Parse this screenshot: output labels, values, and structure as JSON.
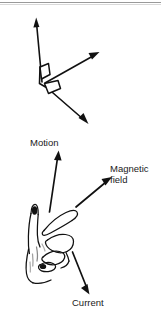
{
  "figure": {
    "title_text": "",
    "stroke_color": "#111111",
    "background_color": "#ffffff",
    "rule_color": "#9a9a9a",
    "axes_diagram": {
      "name": "three-perpendicular-axes",
      "vertex": [
        42,
        80
      ],
      "arrows": [
        {
          "name": "vertical-axis-arrow",
          "from": [
            42,
            80
          ],
          "to": [
            36,
            19
          ],
          "direction": "up"
        },
        {
          "name": "upper-right-axis-arrow",
          "from": [
            44,
            82
          ],
          "to": [
            98,
            52
          ],
          "direction": "up-right"
        },
        {
          "name": "lower-right-axis-arrow",
          "from": [
            44,
            84
          ],
          "to": [
            88,
            124
          ],
          "direction": "down-right"
        }
      ],
      "right_angle_markers": 2
    },
    "hand_diagram": {
      "name": "right-hand-fleming-rule",
      "description": "open right hand with thumb, index finger and middle finger mutually perpendicular"
    },
    "labels": [
      {
        "id": "motion",
        "text": "Motion",
        "x": 30,
        "y": 137
      },
      {
        "id": "magnetic_field",
        "text": "Magnetic\nfield",
        "line1": "Magnetic",
        "line2": "field",
        "x": 110,
        "y": 163
      },
      {
        "id": "current",
        "text": "Current",
        "x": 72,
        "y": 297
      }
    ],
    "annotation_arrows": [
      {
        "name": "motion-arrow",
        "label": "Motion",
        "from": [
          49,
          210
        ],
        "to": [
          58,
          152
        ],
        "direction": "up"
      },
      {
        "name": "magnetic-field-arrow",
        "label": "Magnetic field",
        "from": [
          76,
          206
        ],
        "to": [
          110,
          179
        ],
        "direction": "up-right"
      },
      {
        "name": "current-arrow",
        "label": "Current",
        "from": [
          73,
          252
        ],
        "to": [
          90,
          293
        ],
        "direction": "down-right"
      }
    ]
  }
}
